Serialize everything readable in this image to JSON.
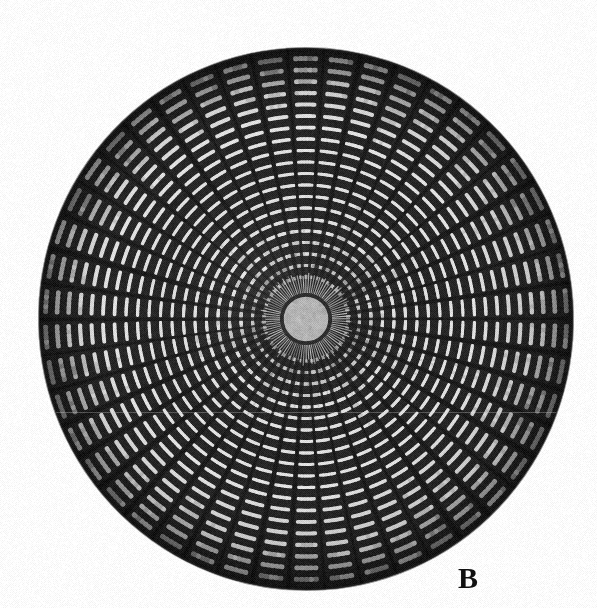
{
  "figure": {
    "domain": "Natural-Image",
    "kind": "light-micrograph",
    "background_color": "#ffffff",
    "canvas": {
      "width": 597,
      "height": 608
    }
  },
  "panel_label": {
    "text": "B",
    "x": 458,
    "y": 563,
    "font_size": 30,
    "weight": "bold",
    "style": "serif",
    "color": "#111111"
  },
  "specimen": {
    "name": "diatom-valve",
    "center_x": 306,
    "center_y": 319,
    "radius_x": 267,
    "radius_y": 271,
    "rotation_deg": -4,
    "outline_color": "#2b2b2b",
    "body_tone": "#3a3a3a"
  },
  "central_area": {
    "name": "hyaline-central-area",
    "radius": 24,
    "fill_color": "#b3b3b3",
    "ring_color": "#2e2e2e",
    "ring_width": 3.5,
    "corona_ray_count": 96,
    "corona_inner_radius": 26,
    "corona_outer_radius": 44,
    "corona_color": "#c9c9c9"
  },
  "pattern": {
    "costae_count": 46,
    "costa_color": "#1a1a1a",
    "costa_angular_width_deg": 2.6,
    "areola_color_bright": "#e2e2e2",
    "areola_color_mid": "#c6c6c6",
    "areola_color_dim": "#9a9a9a",
    "areola_rows_per_sector": 5,
    "areola_radial_pitch": 11.5,
    "areola_start_radius": 42,
    "interstria_color": "#262626",
    "margin_band_inner": 246,
    "margin_band_outer": 268,
    "margin_band_color": "#151515"
  },
  "artifacts": {
    "scan_line_y": 412,
    "scan_line_color": "#d8d8d8",
    "vignette_strength": 0.28,
    "halftone_grain": true
  },
  "colors": {
    "white": "#ffffff",
    "near_black": "#111111",
    "mid_gray": "#b3b3b3",
    "dark_gray": "#2e2e2e"
  }
}
